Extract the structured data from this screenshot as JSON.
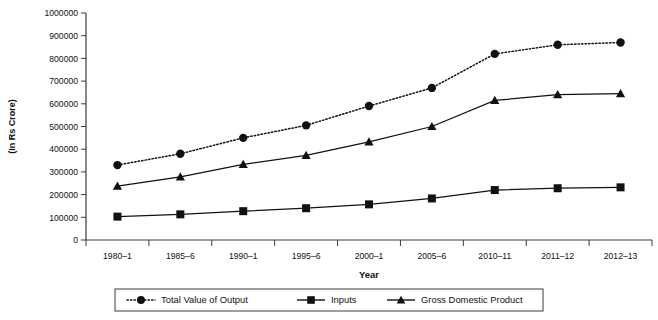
{
  "chart_data": {
    "type": "line",
    "title": "",
    "xlabel": "Year",
    "ylabel": "(In Rs Crore)",
    "categories": [
      "1980–1",
      "1985–6",
      "1990–1",
      "1995–6",
      "2000–1",
      "2005–6",
      "2010–11",
      "2011–12",
      "2012–13"
    ],
    "ylim": [
      0,
      1000000
    ],
    "ytick_step": 100000,
    "ytick_labels": [
      "0",
      "100000",
      "200000",
      "300000",
      "400000",
      "500000",
      "600000",
      "700000",
      "800000",
      "900000",
      "1000000"
    ],
    "grid": false,
    "legend_position": "bottom",
    "series": [
      {
        "name": "Total  Value of Output",
        "marker": "circle",
        "line_style": "dotted",
        "color": "#111111",
        "values": [
          330000,
          380000,
          450000,
          505000,
          590000,
          670000,
          820000,
          860000,
          870000
        ]
      },
      {
        "name": "Inputs",
        "marker": "square",
        "line_style": "solid",
        "color": "#111111",
        "values": [
          103000,
          113000,
          127000,
          140000,
          157000,
          183000,
          220000,
          228000,
          232000
        ]
      },
      {
        "name": "Gross Domestic Product",
        "marker": "triangle",
        "line_style": "solid",
        "color": "#111111",
        "values": [
          237000,
          278000,
          333000,
          373000,
          432000,
          500000,
          615000,
          640000,
          645000
        ]
      }
    ]
  },
  "legend": {
    "items": [
      {
        "label": "Total  Value of Output",
        "marker": "circle-marker",
        "style": "dotted"
      },
      {
        "label": "Inputs",
        "marker": "square-marker",
        "style": "solid"
      },
      {
        "label": "Gross Domestic Product",
        "marker": "triangle-marker",
        "style": "solid"
      }
    ]
  }
}
